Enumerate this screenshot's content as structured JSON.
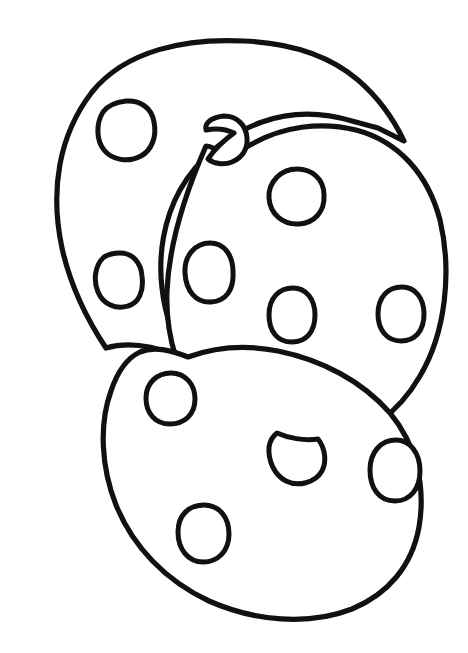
{
  "artwork": {
    "title": "Three Chocolate Chip Cookies Coloring Page",
    "style": "hand-drawn black line art, uncolored",
    "background_color": "#ffffff",
    "line_color": "#111111",
    "canvas": {
      "width": 468,
      "height": 653
    }
  },
  "cookies": [
    {
      "id": "back-cookie",
      "label": "Back cookie (upper left)",
      "z_order": 1,
      "outline_path": "M 243 40 C 300 45 338 62 368 95 L 330 120 C 300 108 268 108 241 122 C 205 140 180 176 172 219 C 166 258 173 300 192 333 C 205 356 222 371 234 382 L 186 356 C 160 346 138 342 118 345 C 93 312 75 278 67 243 C 50 180 60 123 98 80 C 133 46 190 36 243 40 Z",
      "chips": [
        {
          "id": "back-chip-1",
          "cx": 125,
          "cy": 129,
          "rx": 28,
          "ry": 28
        },
        {
          "id": "back-chip-2",
          "cx": 118,
          "cy": 279,
          "rx": 23,
          "ry": 26
        }
      ]
    },
    {
      "id": "middle-cookie",
      "label": "Middle cookie (right)",
      "z_order": 2,
      "outline_path": "M 232 148 C 268 124 312 118 352 128 C 398 140 428 175 440 222 C 452 272 446 330 424 374 C 404 414 372 438 332 446 C 300 452 272 448 252 440 C 232 432 220 422 210 412 C 192 396 180 378 174 360 C 168 340 165 318 166 295 C 168 248 186 194 214 162 Z",
      "chips": [
        {
          "id": "mid-chip-top",
          "cx": 296,
          "cy": 196,
          "rx": 28,
          "ry": 27
        },
        {
          "id": "mid-chip-left",
          "cx": 209,
          "cy": 272,
          "rx": 24,
          "ry": 29
        },
        {
          "id": "mid-chip-center",
          "cx": 292,
          "cy": 315,
          "rx": 23,
          "ry": 27
        },
        {
          "id": "mid-chip-right",
          "cx": 401,
          "cy": 314,
          "rx": 23,
          "ry": 27
        },
        {
          "id": "mid-chip-rim",
          "cx": 224,
          "cy": 139,
          "rx": 23,
          "ry": 22
        },
        {
          "id": "mid-chip-bottom",
          "cx": 314,
          "cy": 412,
          "rx": 27,
          "ry": 23
        }
      ]
    },
    {
      "id": "front-cookie",
      "label": "Front cookie (bottom)",
      "z_order": 3,
      "outline_path": "M 186 356 C 214 346 246 344 276 350 C 318 358 358 378 386 410 C 414 444 424 488 418 530 C 412 568 390 596 356 610 C 312 626 258 622 212 602 C 168 582 134 548 116 506 C 100 468 98 424 110 390 C 116 372 126 360 140 352 C 154 346 170 350 186 356 Z",
      "chips": [
        {
          "id": "front-chip-top",
          "cx": 170,
          "cy": 398,
          "rx": 25,
          "ry": 25
        },
        {
          "id": "front-chip-bottom",
          "cx": 203,
          "cy": 533,
          "rx": 26,
          "ry": 28
        },
        {
          "id": "front-chip-right",
          "cx": 395,
          "cy": 470,
          "rx": 24,
          "ry": 30
        },
        {
          "id": "front-chip-hanging",
          "cx": 300,
          "cy": 452,
          "rx": 25,
          "ry": 25
        }
      ]
    }
  ]
}
